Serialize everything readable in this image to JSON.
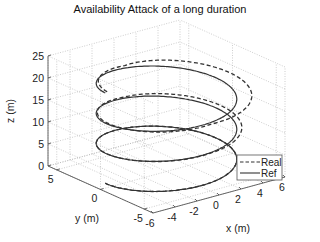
{
  "chart_data": {
    "type": "line",
    "subtype": "3d-helix",
    "title": "Availability Attack of a long duration",
    "xlabel": "x (m)",
    "ylabel": "y (m)",
    "zlabel": "z (m)",
    "xlim": [
      -6,
      6
    ],
    "ylim": [
      -6,
      6
    ],
    "zlim": [
      0,
      25
    ],
    "xticks": [
      -6,
      -4,
      -2,
      0,
      2,
      4,
      6
    ],
    "yticks": [
      -5,
      0,
      5
    ],
    "zticks": [
      0,
      5,
      10,
      15,
      20,
      25
    ],
    "grid": true,
    "legend_position": "lower right",
    "series": [
      {
        "name": "Real",
        "style": "dashed",
        "color": "#333333",
        "radius": 5,
        "z_start": 0,
        "z_end": 20,
        "turns": 3,
        "deviation": "wider radius on +x side in upper turns"
      },
      {
        "name": "Ref",
        "style": "solid",
        "color": "#333333",
        "radius": 5,
        "z_start": 0,
        "z_end": 20,
        "turns": 3
      }
    ]
  },
  "labels": {
    "title": "Availability Attack of a long duration",
    "xlabel": "x (m)",
    "ylabel": "y (m)",
    "zlabel": "z (m)",
    "zticks": [
      "0",
      "5",
      "10",
      "15",
      "20",
      "25"
    ],
    "yticks": [
      "5",
      "0",
      "-5"
    ],
    "xticks": [
      "-6",
      "-4",
      "-2",
      "0",
      "2",
      "4",
      "6"
    ],
    "legend": [
      "Real",
      "Ref"
    ]
  }
}
